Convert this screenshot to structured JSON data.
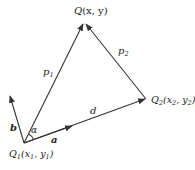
{
  "diagram": {
    "colors": {
      "stroke": "#333333",
      "text": "#222222",
      "background": "#ffffff"
    },
    "points": {
      "Q": {
        "name": "Q",
        "coords_label": "(x, y)",
        "x": 84,
        "y": 22
      },
      "Q1": {
        "name": "Q",
        "sub": "1",
        "coords_open": "(x",
        "coords_sub1": "1",
        "coords_mid": ", y",
        "coords_sub2": "1",
        "coords_close": ")",
        "x": 24,
        "y": 143
      },
      "Q2": {
        "name": "Q",
        "sub": "2",
        "coords_open": "(x",
        "coords_sub1": "2",
        "coords_mid": ", y",
        "coords_sub2": "2",
        "coords_close": ")",
        "x": 146,
        "y": 99
      }
    },
    "vectors": {
      "p1": {
        "label": "p",
        "sub": "1",
        "from": "Q1",
        "to": "Q"
      },
      "p2": {
        "label": "p",
        "sub": "2",
        "from": "Q2",
        "to": "Q"
      },
      "d": {
        "label": "d",
        "from": "Q1",
        "to": "Q2"
      },
      "a": {
        "label": "a",
        "bold": true,
        "from": "Q1",
        "direction": "along d"
      },
      "b": {
        "label": "b",
        "bold": true,
        "from": "Q1",
        "direction": "perpendicular-ish to a"
      }
    },
    "angle": {
      "label": "α",
      "between": [
        "a",
        "p1"
      ],
      "vertex": "Q1"
    }
  }
}
